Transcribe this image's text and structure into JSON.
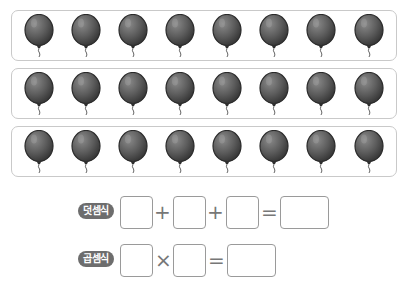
{
  "rows": [
    {
      "count": 8,
      "top": 10
    },
    {
      "count": 8,
      "top": 68
    },
    {
      "count": 8,
      "top": 126
    }
  ],
  "balloon": {
    "icon": "balloon-icon",
    "color": "#5a5a5a",
    "per_row": 8,
    "rows": 3
  },
  "equations": {
    "addition": {
      "label": "덧셈식",
      "op1": "+",
      "op2": "+",
      "eq": "=",
      "blanks": [
        "",
        "",
        "",
        ""
      ]
    },
    "multiplication": {
      "label": "곱셈식",
      "op1": "×",
      "eq": "=",
      "blanks": [
        "",
        "",
        ""
      ]
    }
  }
}
